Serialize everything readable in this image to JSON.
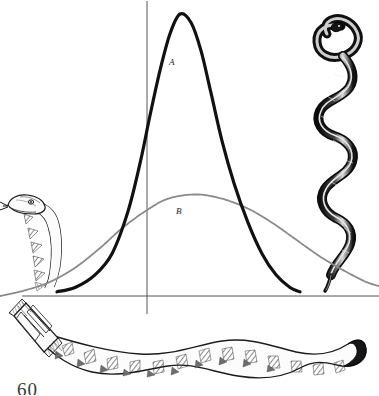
{
  "figure": {
    "background_color": "#ffffff",
    "ink_color": "#111111",
    "secondary_ink_color": "#8a8a8a",
    "axis_color": "#55565a",
    "page_number": "60",
    "labels": {
      "curve_a": "A",
      "curve_b": "B"
    },
    "illustrations": [
      {
        "name": "snake-head-left",
        "description": "engraved snake head with forked tongue, left side"
      },
      {
        "name": "snake-coiled-right",
        "description": "dark coiled serpent, right side"
      },
      {
        "name": "rattlesnake-bottom",
        "description": "long wavy rattlesnake with rattle, bottom"
      }
    ]
  },
  "chart_data": {
    "type": "line",
    "title": "",
    "xlabel": "",
    "ylabel": "",
    "grid": false,
    "legend": "inline-labels",
    "xlim": [
      0,
      379
    ],
    "ylim": [
      0,
      1
    ],
    "axes": {
      "vertical_line_x": 147,
      "baseline_y": 296
    },
    "series": [
      {
        "name": "A",
        "label": "A",
        "color": "#111111",
        "style": "solid-thick",
        "peak_x": 180,
        "peak_y_value": 1.0,
        "points": [
          [
            57,
            0.015
          ],
          [
            75,
            0.03
          ],
          [
            95,
            0.075
          ],
          [
            112,
            0.15
          ],
          [
            128,
            0.3
          ],
          [
            140,
            0.47
          ],
          [
            150,
            0.64
          ],
          [
            160,
            0.8
          ],
          [
            170,
            0.93
          ],
          [
            180,
            1.0
          ],
          [
            191,
            0.97
          ],
          [
            201,
            0.87
          ],
          [
            211,
            0.72
          ],
          [
            222,
            0.55
          ],
          [
            234,
            0.4
          ],
          [
            248,
            0.26
          ],
          [
            262,
            0.15
          ],
          [
            276,
            0.075
          ],
          [
            290,
            0.03
          ],
          [
            300,
            0.015
          ]
        ]
      },
      {
        "name": "B",
        "label": "B",
        "color": "#8a8a8a",
        "style": "stippled-thin",
        "peak_x": 196,
        "peak_y_value": 0.36,
        "points": [
          [
            0,
            0.0
          ],
          [
            25,
            0.02
          ],
          [
            50,
            0.05
          ],
          [
            75,
            0.1
          ],
          [
            100,
            0.17
          ],
          [
            122,
            0.24
          ],
          [
            145,
            0.3
          ],
          [
            168,
            0.345
          ],
          [
            196,
            0.36
          ],
          [
            222,
            0.345
          ],
          [
            248,
            0.31
          ],
          [
            272,
            0.26
          ],
          [
            296,
            0.2
          ],
          [
            320,
            0.14
          ],
          [
            344,
            0.09
          ],
          [
            366,
            0.05
          ],
          [
            379,
            0.035
          ]
        ]
      }
    ]
  }
}
